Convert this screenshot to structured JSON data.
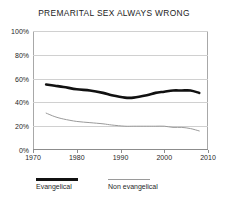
{
  "chart_data": {
    "type": "line",
    "title": "PREMARITAL SEX ALWAYS WRONG",
    "xlabel": "",
    "ylabel": "",
    "xlim": [
      1970,
      2010
    ],
    "ylim": [
      0,
      100
    ],
    "grid": true,
    "legend_position": "bottom-left",
    "x_ticks": [
      "1970",
      "1980",
      "1990",
      "2000",
      "2010"
    ],
    "x_tick_values": [
      1970,
      1980,
      1990,
      2000,
      2010
    ],
    "y_ticks": [
      "0%",
      "20%",
      "40%",
      "60%",
      "80%",
      "100%"
    ],
    "y_tick_values": [
      0,
      20,
      40,
      60,
      80,
      100
    ],
    "series": [
      {
        "name": "Evangelical",
        "color": "#111111",
        "width": 2.6,
        "x": [
          1973,
          1975,
          1977,
          1980,
          1983,
          1986,
          1988,
          1991,
          1993,
          1996,
          1998,
          2000,
          2002,
          2004,
          2006,
          2008
        ],
        "values": [
          55,
          54,
          53,
          51,
          50,
          48,
          46,
          44,
          44,
          46,
          48,
          49,
          50,
          50,
          50,
          48
        ]
      },
      {
        "name": "Non evangelical",
        "color": "#9a9a9a",
        "width": 1,
        "x": [
          1973,
          1975,
          1977,
          1980,
          1983,
          1986,
          1988,
          1991,
          1993,
          1996,
          1998,
          2000,
          2002,
          2004,
          2006,
          2008
        ],
        "values": [
          31,
          28,
          26,
          24,
          23,
          22,
          21,
          20,
          20,
          20,
          20,
          20,
          19,
          19,
          18,
          16
        ]
      }
    ]
  },
  "legend": {
    "items": [
      {
        "label": "Evangelical"
      },
      {
        "label": "Non evangelical"
      }
    ]
  }
}
